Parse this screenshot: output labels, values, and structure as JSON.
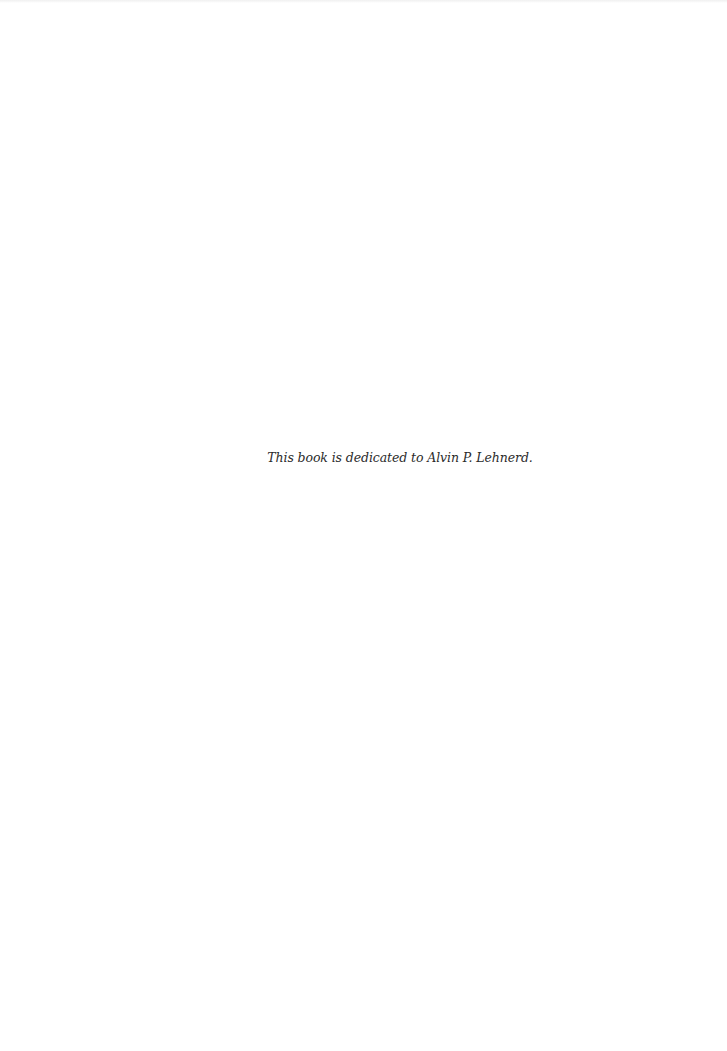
{
  "page": {
    "dedication_text": "This book is dedicated to Alvin P. Lehnerd."
  },
  "colors": {
    "background": "#ffffff",
    "text": "#2b2b2b"
  }
}
